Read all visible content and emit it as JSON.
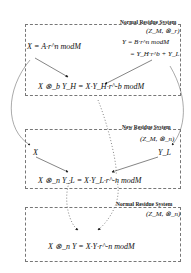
{
  "systems": [
    {
      "title": "Normal Residue System",
      "group": "(Z_M, ⊗_r)",
      "left_eq": "X = A·r^n modM",
      "right_eq_1": "Y = B·r^n modM",
      "right_eq_2": "= Y_H·r^b + Y_L",
      "result_eq": "X ⊗_b Y_H = X·Y_H·r^-b modM"
    },
    {
      "title": "New Residue System",
      "group": "(Z_M, ⊗_n)",
      "left_var": "X",
      "right_var": "Y_L",
      "result_eq": "X ⊗_n Y_L = X·Y_L·r^-n modM"
    },
    {
      "title": "Normal Residue System",
      "group": "(Z_M, ⊗_n)",
      "result_eq": "X ⊗_n Y = X·Y·r^-n modM"
    }
  ]
}
